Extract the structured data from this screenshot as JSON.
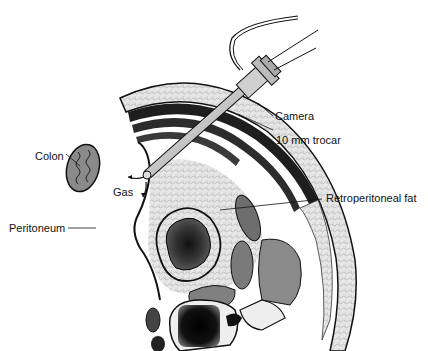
{
  "figure": {
    "type": "medical illustration"
  },
  "labels": {
    "camera": "Camera",
    "trocar": "10 mm trocar",
    "colon": "Colon",
    "gas": "Gas",
    "retroperitoneal_fat": "Retroperitoneal fat",
    "peritoneum": "Peritoneum"
  },
  "colors": {
    "outline": "#111111",
    "muscle_dark": "#222222",
    "fat_texture": "#d8d8d8",
    "organ_gray": "#8a8a8a",
    "kidney_dark": "#2a2a2a",
    "bone_light": "#eeeeee",
    "instrument": "#c8c8c8"
  }
}
